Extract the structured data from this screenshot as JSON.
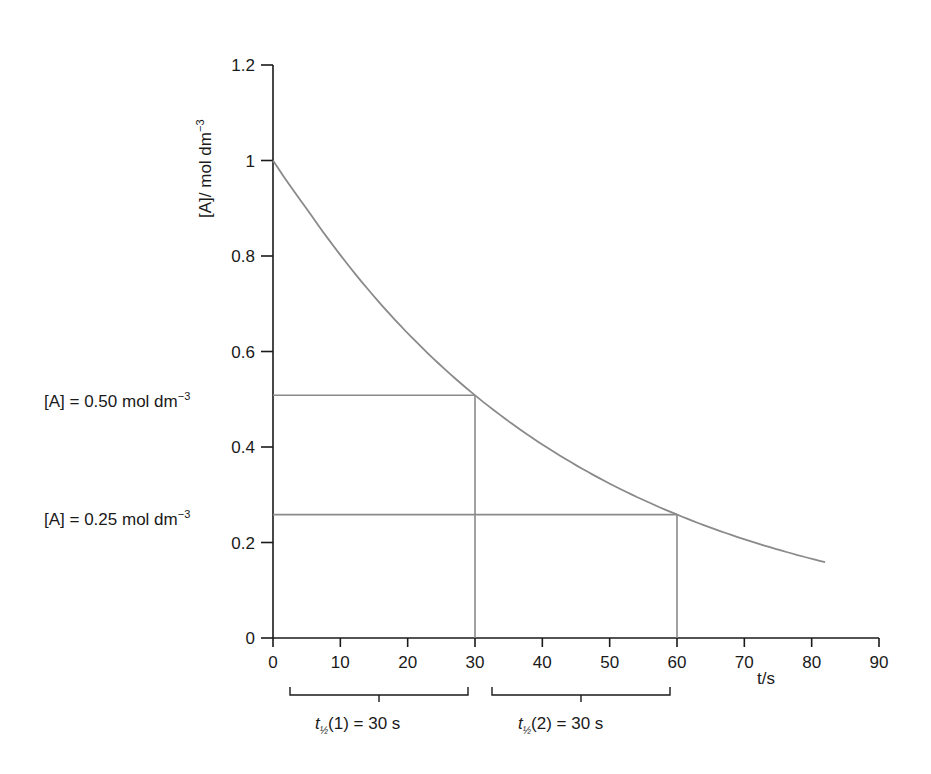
{
  "chart_data": {
    "type": "line",
    "title": "",
    "xlabel": "t/s",
    "ylabel": "[A]/ mol dm",
    "ylabel_sup": "−3",
    "xlim": [
      0,
      90
    ],
    "ylim": [
      0,
      1.2
    ],
    "x_ticks": [
      "0",
      "10",
      "20",
      "30",
      "40",
      "50",
      "60",
      "70",
      "80",
      "90"
    ],
    "y_ticks": [
      "0",
      "0.2",
      "0.4",
      "0.6",
      "0.8",
      "1",
      "1.2"
    ],
    "grid": false,
    "series": [
      {
        "name": "[A] vs t (first-order decay)",
        "color": "#8a8a8a",
        "x": [
          0,
          5,
          10,
          15,
          20,
          25,
          30,
          35,
          40,
          45,
          50,
          55,
          60,
          65,
          70,
          75,
          80,
          82
        ],
        "y": [
          1.0,
          0.89,
          0.79,
          0.71,
          0.63,
          0.56,
          0.5,
          0.45,
          0.4,
          0.35,
          0.31,
          0.28,
          0.25,
          0.22,
          0.2,
          0.18,
          0.16,
          0.15
        ]
      }
    ],
    "guides": [
      {
        "type": "hline",
        "y": 0.5,
        "x_from": 0,
        "x_to": 30
      },
      {
        "type": "vline",
        "x": 30,
        "y_from": 0,
        "y_to": 0.5
      },
      {
        "type": "hline",
        "y": 0.25,
        "x_from": 0,
        "x_to": 60
      },
      {
        "type": "vline",
        "x": 60,
        "y_from": 0,
        "y_to": 0.25
      }
    ],
    "annotations": {
      "a050": {
        "text": "[A] = 0.50 mol dm",
        "sup": "−3"
      },
      "a025": {
        "text": "[A] = 0.25 mol dm",
        "sup": "−3"
      },
      "half1": {
        "t": "t",
        "sub": "½",
        "rest": "(1) = 30 s"
      },
      "half2": {
        "t": "t",
        "sub": "½",
        "rest": "(2) = 30 s"
      }
    }
  }
}
